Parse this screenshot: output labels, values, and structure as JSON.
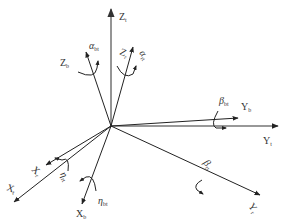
{
  "diagram": {
    "title": "",
    "origin": {
      "x": 111,
      "y": 126
    },
    "axes": [
      {
        "id": "Zt",
        "label": "Z",
        "sub": "t",
        "end": [
          111,
          8
        ],
        "color": "#888888",
        "width": 1.8,
        "label_pos": [
          121,
          20
        ]
      },
      {
        "id": "Zb",
        "label": "Z",
        "sub": "b",
        "end": [
          86,
          52
        ],
        "color": "#222222",
        "width": 1,
        "label_pos": [
          60,
          66
        ]
      },
      {
        "id": "Zr",
        "label": "Z",
        "sub": "r",
        "end": [
          133,
          47
        ],
        "color": "#222222",
        "width": 1,
        "label_pos": [
          119,
          54
        ],
        "rotate": 25
      },
      {
        "id": "Yt",
        "label": "Y",
        "sub": "t",
        "end": [
          278,
          126
        ],
        "color": "#222222",
        "width": 1.2,
        "label_pos": [
          264,
          144
        ]
      },
      {
        "id": "Yb",
        "label": "Y",
        "sub": "b",
        "end": [
          238,
          118
        ],
        "color": "#222222",
        "width": 1,
        "label_pos": [
          242,
          110
        ]
      },
      {
        "id": "Yr",
        "label": "Y",
        "sub": "r",
        "end": [
          260,
          195
        ],
        "color": "#222222",
        "width": 1,
        "label_pos": [
          252,
          210
        ],
        "rotate": 50
      },
      {
        "id": "Xt",
        "label": "X",
        "sub": "t",
        "end": [
          14,
          202
        ],
        "color": "#222222",
        "width": 1,
        "label_pos": [
          6,
          190
        ],
        "rotate": 20
      },
      {
        "id": "Xr",
        "label": "X",
        "sub": "r",
        "end": [
          46,
          165
        ],
        "color": "#222222",
        "width": 1,
        "label_pos": [
          28,
          176
        ],
        "rotate": 40
      },
      {
        "id": "Xb",
        "label": "X",
        "sub": "b",
        "end": [
          82,
          204
        ],
        "color": "#222222",
        "width": 1,
        "label_pos": [
          75,
          218
        ]
      }
    ],
    "rotations": [
      {
        "id": "alpha_bt",
        "symbol": "α",
        "sub": "bt",
        "label_pos": [
          90,
          51
        ]
      },
      {
        "id": "alpha_rt",
        "symbol": "α",
        "sub": "rt",
        "label_pos": [
          140,
          58
        ],
        "rotate": 55
      },
      {
        "id": "beta_bt",
        "symbol": "β",
        "sub": "bt",
        "label_pos": [
          221,
          104
        ]
      },
      {
        "id": "beta_rt",
        "symbol": "β",
        "sub": "rt",
        "label_pos": [
          203,
          166
        ],
        "rotate": 50
      },
      {
        "id": "eta_rt",
        "symbol": "η",
        "sub": "rt",
        "label_pos": [
          60,
          180
        ],
        "rotate": 60
      },
      {
        "id": "eta_bt",
        "symbol": "η",
        "sub": "bt",
        "label_pos": [
          98,
          208
        ]
      }
    ]
  },
  "labels": {
    "Zt": "Z",
    "Zt_sub": "t",
    "Zb": "Z",
    "Zb_sub": "b",
    "Zr": "Z",
    "Zr_sub": "r",
    "Yt": "Y",
    "Yt_sub": "t",
    "Yb": "Y",
    "Yb_sub": "b",
    "Yr": "Y",
    "Yr_sub": "r",
    "Xt": "X",
    "Xt_sub": "t",
    "Xr": "X",
    "Xr_sub": "r",
    "Xb": "X",
    "Xb_sub": "b",
    "alpha_bt": "α",
    "alpha_bt_sub": "bt",
    "alpha_rt": "α",
    "alpha_rt_sub": "rt",
    "beta_bt": "β",
    "beta_bt_sub": "bt",
    "beta_rt": "β",
    "beta_rt_sub": "rt",
    "eta_rt": "η",
    "eta_rt_sub": "rt",
    "eta_bt": "η",
    "eta_bt_sub": "bt"
  }
}
